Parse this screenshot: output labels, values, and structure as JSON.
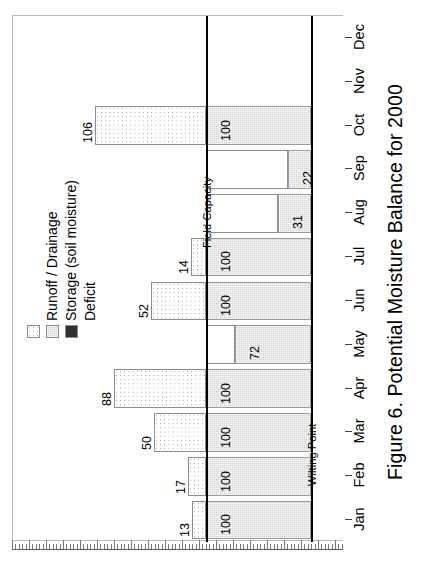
{
  "figure": {
    "caption": "Figure 6.  Potential Moisture Balance for 2000"
  },
  "legend": {
    "position": "inside-upper-left",
    "items": [
      {
        "label": "Runoff / Drainage",
        "swatch": "white-dotted",
        "color": "#ffffff"
      },
      {
        "label": "Storage (soil moisture)",
        "swatch": "gray-stippled",
        "color": "#d5d5d5"
      },
      {
        "label": "Deficit",
        "swatch": "dark-solid",
        "color": "#303030"
      }
    ]
  },
  "reference_lines": [
    {
      "name": "field-capacity",
      "label": "Field Capacity",
      "value": 100
    },
    {
      "name": "wilting-point",
      "label": "Wilting Point",
      "value": 0
    }
  ],
  "axis": {
    "categories": [
      "Jan",
      "Feb",
      "Mar",
      "Apr",
      "May",
      "Jun",
      "Jul",
      "Aug",
      "Sep",
      "Oct",
      "Nov",
      "Dec"
    ],
    "value_axis_ticks": "unlabeled-fine-ruler",
    "orientation": "horizontal-bars-rotated"
  },
  "chart_data": {
    "type": "bar",
    "title": "Potential Moisture Balance for 2000",
    "xlabel": "",
    "ylabel": "",
    "orientation": "horizontal",
    "grid": false,
    "legend_position": "inside-upper-left",
    "categories": [
      "Jan",
      "Feb",
      "Mar",
      "Apr",
      "May",
      "Jun",
      "Jul",
      "Aug",
      "Sep",
      "Oct",
      "Nov",
      "Dec"
    ],
    "series": [
      {
        "name": "Storage (soil moisture)",
        "values": [
          100,
          100,
          100,
          100,
          72,
          100,
          100,
          31,
          22,
          100,
          null,
          null
        ]
      },
      {
        "name": "Runoff / Drainage",
        "values": [
          13,
          17,
          50,
          88,
          0,
          52,
          14,
          0,
          0,
          106,
          null,
          null
        ]
      },
      {
        "name": "Deficit",
        "values": [
          0,
          0,
          0,
          0,
          0,
          0,
          0,
          0,
          0,
          0,
          null,
          null
        ]
      }
    ],
    "bar_labels": {
      "Jan": [
        "13",
        "100"
      ],
      "Feb": [
        "17",
        "100"
      ],
      "Mar": [
        "50",
        "100"
      ],
      "Apr": [
        "88",
        "100"
      ],
      "May": [
        "72"
      ],
      "Jun": [
        "52",
        "100"
      ],
      "Jul": [
        "14",
        "100"
      ],
      "Aug": [
        "31"
      ],
      "Sep": [
        "22"
      ],
      "Oct": [
        "106",
        "100"
      ],
      "Nov": [],
      "Dec": []
    },
    "xlim": [
      -110,
      115
    ]
  }
}
